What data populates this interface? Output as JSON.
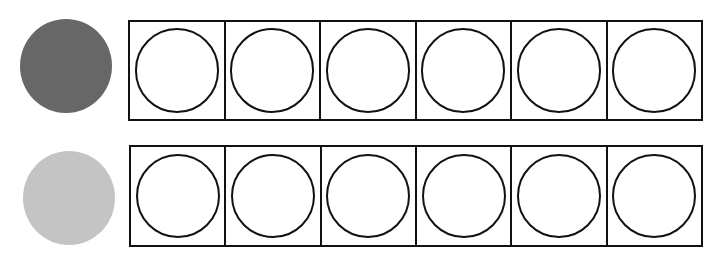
{
  "rows": [
    {
      "counter": {
        "color": "#676767",
        "label": "dark counter"
      },
      "frame": {
        "cells": 6,
        "filled": 0
      }
    },
    {
      "counter": {
        "color": "#c4c4c4",
        "label": "light counter"
      },
      "frame": {
        "cells": 6,
        "filled": 0
      }
    }
  ]
}
